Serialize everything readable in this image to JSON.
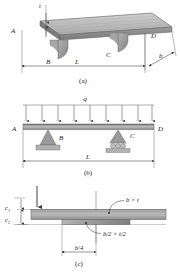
{
  "figure": {
    "panels": [
      {
        "id": "a",
        "caption": "(a)",
        "description": "Perspective view of plate supported by two brackets",
        "labels": {
          "thickness": "t",
          "end_left": "A",
          "bracket_left": "B",
          "bracket_right": "C",
          "end_right": "D",
          "span": "L",
          "width": "b"
        }
      },
      {
        "id": "b",
        "caption": "(b)",
        "description": "Free body beam diagram with uniform distributed load",
        "labels": {
          "load": "q",
          "end_left": "A",
          "support_pin": "B",
          "support_roller": "C",
          "end_right": "D",
          "span": "L"
        },
        "load_arrow_count": 9
      },
      {
        "id": "c",
        "caption": "(c)",
        "description": "Cross-section detail of plate and cover plate",
        "labels": {
          "dist_top": "c",
          "dist_top_sub": "1",
          "dist_bot": "c",
          "dist_bot_sub": "2",
          "plate_section": "b × t",
          "cover_section": "b/2 × t/2",
          "cover_width": "b/4"
        }
      }
    ],
    "colors": {
      "plate_top": "#b9b9b9",
      "plate_front": "#8f8f8f",
      "plate_edge": "#6e6e6e",
      "bracket": "#9a9a9a",
      "support": "#a8a8a8",
      "line": "#2b2b2b",
      "thin_line": "#4a4a4a",
      "background": "#ffffff"
    }
  }
}
